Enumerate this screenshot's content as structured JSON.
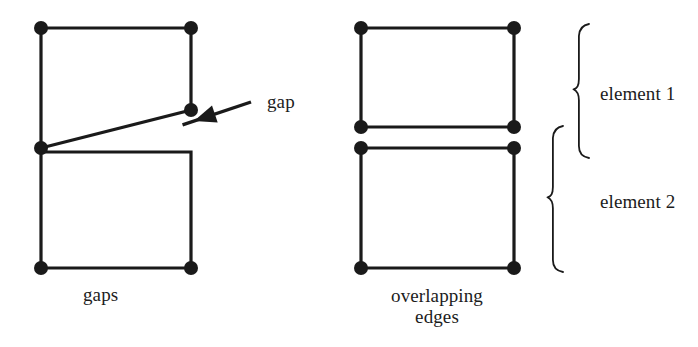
{
  "figure": {
    "background_color": "#ffffff",
    "stroke_color": "#1a1a1a",
    "node_color": "#1a1a1a",
    "text_color": "#1c1c1c"
  },
  "left_diagram": {
    "caption": "gaps",
    "callout": {
      "label": "gap",
      "arrow_tail_x": 251,
      "arrow_tail_y": 102,
      "arrow_head_x": 194,
      "arrow_head_y": 121
    },
    "upper_quad": {
      "name": "element-1-quad",
      "points": [
        [
          41,
          28
        ],
        [
          191,
          28
        ],
        [
          191,
          110
        ],
        [
          41,
          148
        ]
      ],
      "node_points": [
        [
          41,
          28
        ],
        [
          191,
          28
        ],
        [
          191,
          110
        ],
        [
          41,
          148
        ]
      ]
    },
    "lower_quad": {
      "name": "element-2-quad",
      "points": [
        [
          41,
          152
        ],
        [
          191,
          152
        ],
        [
          191,
          268
        ],
        [
          41,
          268
        ]
      ],
      "node_points": [
        [
          41,
          268
        ],
        [
          191,
          268
        ]
      ]
    }
  },
  "right_diagram": {
    "caption_line_1": "overlapping",
    "caption_line_2": "edges",
    "upper_quad": {
      "name": "element-1-quad",
      "points": [
        [
          361,
          28
        ],
        [
          514,
          28
        ],
        [
          514,
          127
        ],
        [
          361,
          127
        ]
      ],
      "node_points": [
        [
          361,
          28
        ],
        [
          514,
          28
        ],
        [
          514,
          127
        ],
        [
          361,
          127
        ]
      ]
    },
    "lower_quad": {
      "name": "element-2-quad",
      "points": [
        [
          361,
          148
        ],
        [
          514,
          148
        ],
        [
          514,
          268
        ],
        [
          361,
          268
        ]
      ],
      "node_points": [
        [
          361,
          148
        ],
        [
          514,
          148
        ],
        [
          514,
          268
        ],
        [
          361,
          268
        ]
      ]
    },
    "brace_element_1": {
      "label": "element 1",
      "top_y": 24,
      "bottom_y": 158,
      "x": 576
    },
    "brace_element_2": {
      "label": "element 2",
      "top_y": 126,
      "bottom_y": 272,
      "x": 550
    }
  },
  "geometry": {
    "node_radius": 7,
    "edge_width": 3.2,
    "brace_width": 1.8
  }
}
